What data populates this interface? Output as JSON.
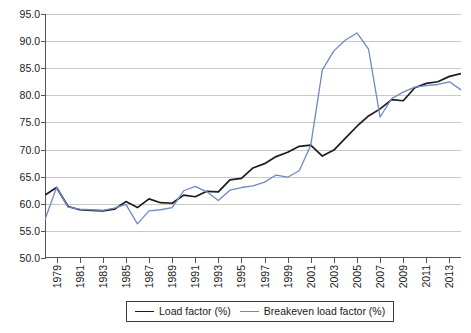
{
  "chart_data": {
    "type": "line",
    "title": "",
    "xlabel": "",
    "ylabel": "",
    "ylim": [
      50.0,
      95.0
    ],
    "ytick_step": 5.0,
    "ytick_labels": [
      "95.0",
      "90.0",
      "85.0",
      "80.0",
      "75.0",
      "70.0",
      "65.0",
      "60.0",
      "55.0",
      "50.0"
    ],
    "ytick_values": [
      95.0,
      90.0,
      85.0,
      80.0,
      75.0,
      70.0,
      65.0,
      60.0,
      55.0,
      50.0
    ],
    "grid": true,
    "grid_axis": "y",
    "legend_position": "bottom-center",
    "xlim": [
      1978,
      2014
    ],
    "xtick_labels": [
      "1979",
      "1981",
      "1983",
      "1985",
      "1987",
      "1989",
      "1991",
      "1993",
      "1995",
      "1997",
      "1999",
      "2001",
      "2003",
      "2005",
      "2007",
      "2009",
      "2011",
      "2013"
    ],
    "xtick_values": [
      1979,
      1981,
      1983,
      1985,
      1987,
      1989,
      1991,
      1993,
      1995,
      1997,
      1999,
      2001,
      2003,
      2005,
      2007,
      2009,
      2011,
      2013
    ],
    "x": [
      1978,
      1979,
      1980,
      1981,
      1982,
      1983,
      1984,
      1985,
      1986,
      1987,
      1988,
      1989,
      1990,
      1991,
      1992,
      1993,
      1994,
      1995,
      1996,
      1997,
      1998,
      1999,
      2000,
      2001,
      2002,
      2003,
      2004,
      2005,
      2006,
      2007,
      2008,
      2009,
      2010,
      2011,
      2012,
      2013,
      2014
    ],
    "series": [
      {
        "name": "Load factor (%)",
        "color": "#1c1c1c",
        "values": [
          61.6,
          63.0,
          59.5,
          58.9,
          58.8,
          58.7,
          59.0,
          60.4,
          59.3,
          60.9,
          60.2,
          60.1,
          61.6,
          61.3,
          62.3,
          62.2,
          64.4,
          64.7,
          66.6,
          67.4,
          68.7,
          69.5,
          70.6,
          70.8,
          68.8,
          69.9,
          72.1,
          74.3,
          76.2,
          77.5,
          79.2,
          79.0,
          81.4,
          82.2,
          82.5,
          83.5,
          84.0
        ]
      },
      {
        "name": "Breakeven load factor (%)",
        "color": "#6e89c3",
        "values": [
          57.1,
          63.0,
          59.4,
          59.0,
          58.9,
          58.8,
          59.2,
          59.9,
          56.3,
          58.7,
          58.9,
          59.3,
          62.4,
          63.2,
          62.2,
          60.6,
          62.5,
          63.0,
          63.3,
          64.0,
          65.3,
          64.9,
          66.1,
          70.8,
          84.7,
          88.2,
          90.2,
          91.5,
          88.5,
          76.0,
          79.4,
          80.6,
          81.5,
          81.8,
          82.0,
          82.5,
          81.0
        ]
      }
    ]
  },
  "legend": {
    "items": [
      {
        "label": "Load factor (%)",
        "color": "#1c1c1c"
      },
      {
        "label": "Breakeven load factor (%)",
        "color": "#6e89c3"
      }
    ]
  }
}
